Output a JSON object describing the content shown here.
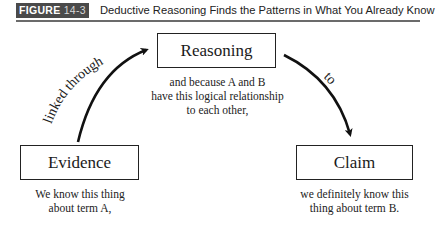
{
  "header": {
    "badge_label": "FIGURE",
    "badge_number": "14-3",
    "title": "Deductive Reasoning Finds the Patterns in What You Already Know"
  },
  "diagram": {
    "nodes": [
      {
        "id": "evidence",
        "label": "Evidence",
        "caption": [
          "We know this thing",
          "about term A,"
        ]
      },
      {
        "id": "reasoning",
        "label": "Reasoning",
        "caption": [
          "and because A and B",
          "have this logical relationship",
          "to each other,"
        ]
      },
      {
        "id": "claim",
        "label": "Claim",
        "caption": [
          "we definitely know this",
          "thing about term B."
        ]
      }
    ],
    "edges": [
      {
        "from": "evidence",
        "to": "reasoning",
        "label": "linked through"
      },
      {
        "from": "reasoning",
        "to": "claim",
        "label": "to"
      }
    ]
  },
  "colors": {
    "badge_bg": "#4a4a4a",
    "rule": "#6b6b6b",
    "ink": "#1a1a1a"
  }
}
